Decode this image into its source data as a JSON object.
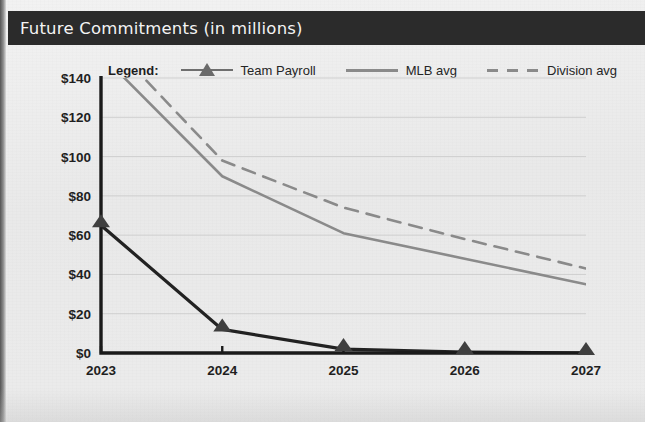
{
  "header": {
    "title": "Future Commitments (in millions)",
    "bar_color": "#2b2b2b",
    "text_color": "#f4f4f4"
  },
  "legend": {
    "title": "Legend:",
    "entries": [
      {
        "label": "Team Payroll",
        "marker": "triangle-marker-icon",
        "style": "solid",
        "color": "#222222"
      },
      {
        "label": "MLB avg",
        "marker": "line-swatch-icon",
        "style": "solid",
        "color": "#8a8a8a"
      },
      {
        "label": "Division avg",
        "marker": "dashed-line-swatch-icon",
        "style": "dashed",
        "color": "#8a8a8a"
      }
    ]
  },
  "axis": {
    "y_ticks": [
      "$0",
      "$20",
      "$40",
      "$60",
      "$80",
      "$100",
      "$120",
      "$140"
    ],
    "x_ticks": [
      "2023",
      "2024",
      "2025",
      "2026",
      "2027"
    ]
  },
  "chart_data": {
    "type": "line",
    "title": "Future Commitments (in millions)",
    "xlabel": "",
    "ylabel": "",
    "categories": [
      "2023",
      "2024",
      "2025",
      "2026",
      "2027"
    ],
    "x": [
      2023,
      2024,
      2025,
      2026,
      2027
    ],
    "ylim": [
      0,
      140
    ],
    "ytick_values": [
      0,
      20,
      40,
      60,
      80,
      100,
      120,
      140
    ],
    "ytick_labels": [
      "$0",
      "$20",
      "$40",
      "$60",
      "$80",
      "$100",
      "$120",
      "$140"
    ],
    "grid": true,
    "grid_axis": "y",
    "legend_position": "above-plot",
    "note": "MLB avg and Division avg series begin above the visible y-axis range at 2023 and are clipped by the plot frame.",
    "series": [
      {
        "name": "Team Payroll",
        "values": [
          65,
          12,
          2,
          0.5,
          0
        ],
        "color": "#222222",
        "style": "solid",
        "marker": "triangle",
        "linewidth": 3.2
      },
      {
        "name": "MLB avg",
        "values": [
          152,
          90,
          61,
          48,
          35
        ],
        "color": "#8a8a8a",
        "style": "solid",
        "marker": "none",
        "linewidth": 2.6
      },
      {
        "name": "Division avg",
        "values": [
          163,
          98,
          74,
          58,
          43
        ],
        "color": "#8a8a8a",
        "style": "dashed",
        "marker": "none",
        "linewidth": 2.6
      }
    ]
  }
}
